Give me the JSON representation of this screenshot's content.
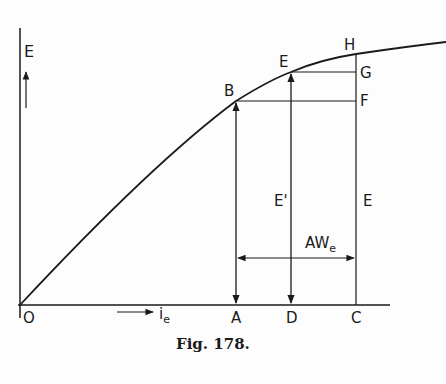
{
  "figure": {
    "caption": "Fig. 178.",
    "axes": {
      "y_label": "E",
      "x_label_main": "i",
      "x_label_sub": "e",
      "origin_label": "O"
    },
    "points": {
      "B": "B",
      "E": "E",
      "H": "H",
      "F": "F",
      "G": "G",
      "A": "A",
      "D": "D",
      "C": "C"
    },
    "segment_labels": {
      "e_prime": "E'",
      "e_right": "E",
      "aw_main": "AW",
      "aw_sub": "e"
    },
    "colors": {
      "ink": "#1a1a1a",
      "background": "#fdfdfd"
    }
  }
}
